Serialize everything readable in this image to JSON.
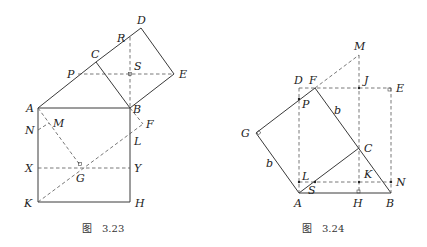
{
  "figures": [
    {
      "caption_prefix": "图",
      "caption_number": "3.23",
      "labels": {
        "A": "A",
        "B": "B",
        "C": "C",
        "D": "D",
        "E": "E",
        "P": "P",
        "R": "R",
        "S": "S",
        "N": "N",
        "M": "M",
        "F": "F",
        "L": "L",
        "X": "X",
        "Y": "Y",
        "G": "G",
        "K": "K",
        "H": "H"
      }
    },
    {
      "caption_prefix": "图",
      "caption_number": "3.24",
      "labels": {
        "M": "M",
        "D": "D",
        "F": "F",
        "J": "J",
        "E": "E",
        "P": "P",
        "G": "G",
        "b1": "b",
        "b2": "b",
        "C": "C",
        "K": "K",
        "L": "L",
        "S": "S",
        "N": "N",
        "A": "A",
        "H": "H",
        "B": "B"
      }
    }
  ]
}
